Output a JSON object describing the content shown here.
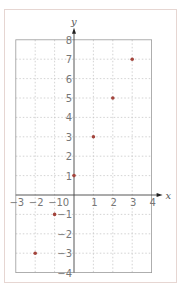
{
  "chart_data": {
    "type": "scatter",
    "title": "",
    "xlabel": "x",
    "ylabel": "y",
    "xlim": [
      -3,
      4
    ],
    "ylim": [
      -4,
      8
    ],
    "grid": true,
    "x_ticks": [
      "-3",
      "-2",
      "-1",
      "0",
      "1",
      "2",
      "3",
      "4"
    ],
    "y_ticks": [
      "8",
      "7",
      "6",
      "5",
      "4",
      "3",
      "2",
      "1",
      "-1",
      "-2",
      "-3",
      "-4"
    ],
    "series": [
      {
        "name": "points",
        "x": [
          -2,
          -1,
          0,
          1,
          2,
          3
        ],
        "y": [
          -3,
          -1,
          1,
          3,
          5,
          7
        ]
      }
    ],
    "colors": {
      "point": "#a3443c",
      "grid": "#c8c8c8",
      "axis": "#444444",
      "frame": "#e6d6d2"
    }
  },
  "labels": {
    "x_axis": "x",
    "y_axis": "y",
    "origin": "0"
  }
}
